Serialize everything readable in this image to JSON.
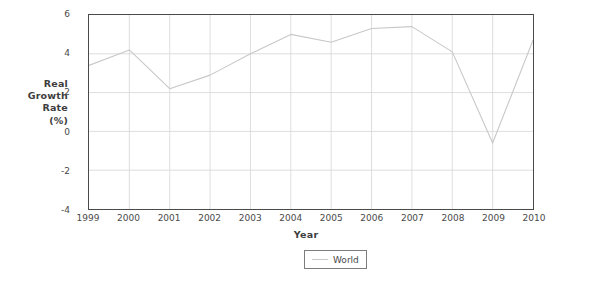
{
  "chart_data": {
    "type": "line",
    "title": "",
    "xlabel": "Year",
    "ylabel": "Real Growth Rate (%)",
    "ylabel_lines": [
      "Real",
      "Growth",
      "Rate",
      "(%)"
    ],
    "x": [
      1999,
      2000,
      2001,
      2002,
      2003,
      2004,
      2005,
      2006,
      2007,
      2008,
      2009,
      2010
    ],
    "xtick_labels": [
      "1999",
      "2000",
      "2001",
      "2002",
      "2003",
      "2004",
      "2005",
      "2006",
      "2007",
      "2008",
      "2009",
      "2010"
    ],
    "ytick_labels": [
      "6",
      "4",
      "2",
      "0",
      "-2",
      "-4"
    ],
    "yticks": [
      6,
      4,
      2,
      0,
      -2,
      -4
    ],
    "xlim": [
      1999,
      2010
    ],
    "ylim": [
      -4,
      6
    ],
    "grid": true,
    "legend_position": "bottom-center",
    "series": [
      {
        "name": "World",
        "color": "#c8c8c8",
        "values": [
          3.4,
          4.2,
          2.2,
          2.9,
          4.0,
          5.0,
          4.6,
          5.3,
          5.4,
          4.1,
          -0.6,
          4.7
        ]
      }
    ]
  },
  "legend": {
    "entries": [
      {
        "label": "World"
      }
    ]
  }
}
